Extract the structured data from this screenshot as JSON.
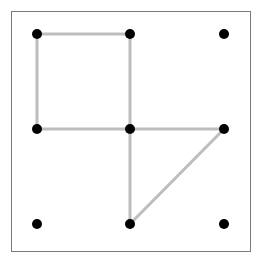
{
  "diagram": {
    "type": "dot-grid-graph",
    "grid": {
      "columns": 3,
      "rows": 3,
      "x_positions": [
        37,
        130,
        224
      ],
      "y_positions": [
        34,
        129,
        224
      ]
    },
    "colors": {
      "background": "#ffffff",
      "frame": "#7a7a7a",
      "edge": "#bdbdbd",
      "dot": "#000000"
    },
    "dot_radius": 5,
    "edge_width": 3,
    "nodes": [
      {
        "id": "r0c0",
        "col": 0,
        "row": 0
      },
      {
        "id": "r0c1",
        "col": 1,
        "row": 0
      },
      {
        "id": "r0c2",
        "col": 2,
        "row": 0
      },
      {
        "id": "r1c0",
        "col": 0,
        "row": 1
      },
      {
        "id": "r1c1",
        "col": 1,
        "row": 1
      },
      {
        "id": "r1c2",
        "col": 2,
        "row": 1
      },
      {
        "id": "r2c0",
        "col": 0,
        "row": 2
      },
      {
        "id": "r2c1",
        "col": 1,
        "row": 2
      },
      {
        "id": "r2c2",
        "col": 2,
        "row": 2
      }
    ],
    "edges": [
      {
        "from": "r0c0",
        "to": "r0c1"
      },
      {
        "from": "r0c0",
        "to": "r1c0"
      },
      {
        "from": "r0c1",
        "to": "r1c1"
      },
      {
        "from": "r1c0",
        "to": "r1c1"
      },
      {
        "from": "r1c1",
        "to": "r1c2"
      },
      {
        "from": "r1c1",
        "to": "r2c1"
      },
      {
        "from": "r1c2",
        "to": "r2c1"
      }
    ]
  }
}
